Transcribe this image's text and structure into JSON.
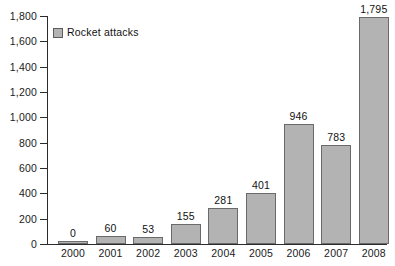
{
  "chart_data": {
    "type": "bar",
    "title": "",
    "xlabel": "",
    "ylabel": "",
    "categories": [
      "2000",
      "2001",
      "2002",
      "2003",
      "2004",
      "2005",
      "2006",
      "2007",
      "2008"
    ],
    "values": [
      0,
      60,
      53,
      155,
      281,
      401,
      946,
      783,
      1795
    ],
    "value_labels": [
      "0",
      "60",
      "53",
      "155",
      "281",
      "401",
      "946",
      "783",
      "1,795"
    ],
    "series": [
      {
        "name": "Rocket attacks",
        "values": [
          0,
          60,
          53,
          155,
          281,
          401,
          946,
          783,
          1795
        ],
        "color": "#b3b3b3",
        "border_color": "#6a6a6a"
      }
    ],
    "ylim": [
      0,
      1800
    ],
    "ytick_values": [
      0,
      200,
      400,
      600,
      800,
      1000,
      1200,
      1400,
      1600,
      1800
    ],
    "ytick_labels": [
      "0",
      "200",
      "400",
      "600",
      "800",
      "1,000",
      "1,200",
      "1,400",
      "1,600",
      "1,800"
    ],
    "grid": false,
    "legend": {
      "position": "top-left-inside",
      "entries": [
        "Rocket attacks"
      ]
    },
    "axis_color": "#2b2b2b",
    "background": "#ffffff"
  },
  "legend": {
    "label": "Rocket attacks"
  },
  "caption": {
    "text": ""
  }
}
